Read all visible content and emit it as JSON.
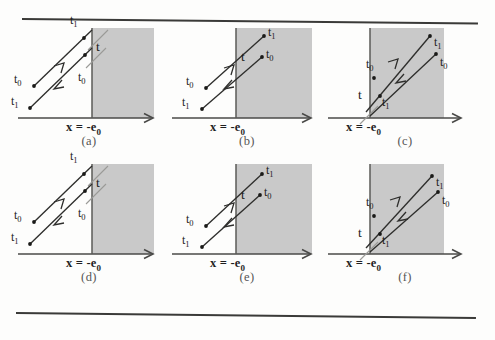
{
  "figure": {
    "axis_label": "x = -e",
    "axis_label_sub": "0",
    "labels": {
      "t0": "t",
      "t0_sub": "0",
      "t1": "t",
      "t1_sub": "1",
      "t": "t"
    },
    "shade_color": "#c9c9c9",
    "line_color": "#2e2e2c",
    "panels": [
      {
        "caption": "(a)",
        "desc": "ray pair reflecting at boundary, endpoints left of boundary",
        "labels": [
          {
            "name": "t1-top",
            "text": "t",
            "sub": "1"
          },
          {
            "name": "t-boundary",
            "text": "t",
            "sub": ""
          },
          {
            "name": "t0-inner",
            "text": "t",
            "sub": "0"
          },
          {
            "name": "t0-left",
            "text": "t",
            "sub": "0"
          },
          {
            "name": "t1-lower",
            "text": "t",
            "sub": "1"
          }
        ]
      },
      {
        "caption": "(b)",
        "desc": "ray pair with endpoints inside shaded region",
        "labels": [
          {
            "name": "t1-top",
            "text": "t",
            "sub": "1"
          },
          {
            "name": "t-boundary",
            "text": "t",
            "sub": ""
          },
          {
            "name": "t0-inner",
            "text": "t",
            "sub": "0"
          },
          {
            "name": "t0-left",
            "text": "t",
            "sub": "0"
          },
          {
            "name": "t1-lower",
            "text": "t",
            "sub": "1"
          }
        ]
      },
      {
        "caption": "(c)",
        "desc": "ray pair fully inside shaded region, vertex at lower boundary",
        "labels": [
          {
            "name": "t0-inner",
            "text": "t",
            "sub": "0"
          },
          {
            "name": "t1-upper",
            "text": "t",
            "sub": "1"
          },
          {
            "name": "t0-right",
            "text": "t",
            "sub": "0"
          },
          {
            "name": "t-boundary",
            "text": "t",
            "sub": ""
          },
          {
            "name": "t1-lower",
            "text": "t",
            "sub": "1"
          }
        ]
      },
      {
        "caption": "(d)",
        "desc": "ray pair reflecting at boundary, endpoints left of boundary",
        "labels": [
          {
            "name": "t1-top",
            "text": "t",
            "sub": "1"
          },
          {
            "name": "t-boundary",
            "text": "t",
            "sub": ""
          },
          {
            "name": "t0-inner",
            "text": "t",
            "sub": "0"
          },
          {
            "name": "t0-left",
            "text": "t",
            "sub": "0"
          },
          {
            "name": "t1-lower",
            "text": "t",
            "sub": "1"
          }
        ]
      },
      {
        "caption": "(e)",
        "desc": "ray pair with endpoints inside shaded region",
        "labels": [
          {
            "name": "t1-top",
            "text": "t",
            "sub": "1"
          },
          {
            "name": "t-boundary",
            "text": "t",
            "sub": ""
          },
          {
            "name": "t0-inner",
            "text": "t",
            "sub": "0"
          },
          {
            "name": "t0-left",
            "text": "t",
            "sub": "0"
          },
          {
            "name": "t1-lower",
            "text": "t",
            "sub": "1"
          }
        ]
      },
      {
        "caption": "(f)",
        "desc": "ray pair fully inside shaded region, vertex at lower boundary",
        "labels": [
          {
            "name": "t0-inner",
            "text": "t",
            "sub": "0"
          },
          {
            "name": "t1-upper",
            "text": "t",
            "sub": "1"
          },
          {
            "name": "t0-right",
            "text": "t",
            "sub": "0"
          },
          {
            "name": "t-boundary",
            "text": "t",
            "sub": ""
          },
          {
            "name": "t1-lower",
            "text": "t",
            "sub": "1"
          }
        ]
      }
    ]
  }
}
